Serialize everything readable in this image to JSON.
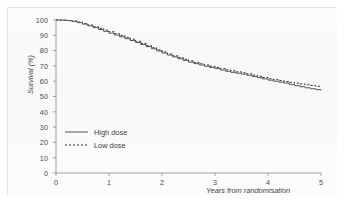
{
  "figure": {
    "kind": "survival-curve-figure",
    "background_color": "#ffffff",
    "panel_border_color": "#e3e3e3"
  },
  "chart_data": {
    "type": "line",
    "title": "",
    "subtitle": "",
    "xlabel": "Years from randomisation",
    "ylabel": "Survival (%)",
    "xlim": [
      0,
      5
    ],
    "ylim": [
      0,
      100
    ],
    "grid": false,
    "legend_position": "inside-lower-left",
    "xticks": [
      "0",
      "1",
      "2",
      "3",
      "4",
      "5"
    ],
    "xtick_values": [
      0,
      1,
      2,
      3,
      4,
      5
    ],
    "yticks": [
      "0",
      "10",
      "20",
      "30",
      "40",
      "50",
      "60",
      "70",
      "80",
      "90",
      "100"
    ],
    "ytick_values": [
      0,
      10,
      20,
      30,
      40,
      50,
      60,
      70,
      80,
      90,
      100
    ],
    "x": [
      0,
      0.1,
      0.2,
      0.3,
      0.4,
      0.5,
      0.6,
      0.7,
      0.8,
      0.9,
      1.0,
      1.1,
      1.2,
      1.3,
      1.4,
      1.5,
      1.6,
      1.7,
      1.8,
      1.9,
      2.0,
      2.1,
      2.2,
      2.3,
      2.4,
      2.5,
      2.6,
      2.7,
      2.8,
      2.9,
      3.0,
      3.1,
      3.2,
      3.3,
      3.4,
      3.5,
      3.6,
      3.7,
      3.8,
      3.9,
      4.0,
      4.1,
      4.2,
      4.3,
      4.4,
      4.5,
      4.6,
      4.7,
      4.8,
      4.9,
      5.0
    ],
    "series": [
      {
        "name": "High dose",
        "style": "solid",
        "color": "#555555",
        "values": [
          100.0,
          99.9,
          99.6,
          99.1,
          98.3,
          97.3,
          96.2,
          95.0,
          93.8,
          92.6,
          91.4,
          90.2,
          89.0,
          87.8,
          86.6,
          85.3,
          84.0,
          82.6,
          81.2,
          79.8,
          78.4,
          77.1,
          75.9,
          74.7,
          73.6,
          72.5,
          71.5,
          70.6,
          69.8,
          69.0,
          68.2,
          67.3,
          66.5,
          65.8,
          65.2,
          64.6,
          63.9,
          63.1,
          62.3,
          61.5,
          60.7,
          60.0,
          59.4,
          58.8,
          57.9,
          57.1,
          56.4,
          55.7,
          55.1,
          54.5,
          54.0
        ]
      },
      {
        "name": "Low dose",
        "style": "dashed",
        "color": "#2f2f2f",
        "values": [
          100.0,
          99.9,
          99.7,
          99.3,
          98.6,
          97.7,
          96.7,
          95.6,
          94.5,
          93.4,
          92.3,
          91.1,
          89.9,
          88.7,
          87.4,
          86.1,
          84.7,
          83.3,
          81.9,
          80.5,
          79.1,
          77.8,
          76.6,
          75.4,
          74.3,
          73.3,
          72.3,
          71.4,
          70.6,
          69.8,
          69.0,
          68.2,
          67.4,
          66.7,
          66.1,
          65.5,
          64.8,
          64.0,
          63.2,
          62.4,
          61.6,
          61.0,
          60.4,
          59.8,
          59.2,
          58.7,
          58.2,
          57.7,
          57.2,
          56.7,
          56.3
        ]
      }
    ],
    "legend": [
      {
        "label": "High dose",
        "style": "solid"
      },
      {
        "label": "Low dose",
        "style": "dashed"
      }
    ]
  }
}
